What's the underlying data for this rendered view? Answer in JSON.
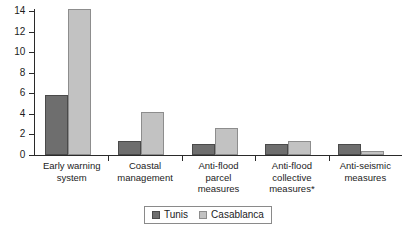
{
  "chart_data": {
    "type": "bar",
    "title": "",
    "subtitle": "",
    "xlabel": "",
    "ylabel": "",
    "ylim": [
      0,
      14
    ],
    "yticks": [
      0,
      2,
      4,
      6,
      8,
      10,
      12,
      14
    ],
    "grid": false,
    "legend_position": "bottom-center",
    "categories": [
      "Early warning system",
      "Coastal management",
      "Anti-flood parcel measures",
      "Anti-flood collective measures*",
      "Anti-seismic measures"
    ],
    "category_lines": [
      [
        "Early warning",
        "system"
      ],
      [
        "Coastal",
        "management"
      ],
      [
        "Anti-flood",
        "parcel",
        "measures"
      ],
      [
        "Anti-flood",
        "collective",
        "measures*"
      ],
      [
        "Anti-seismic",
        "measures"
      ]
    ],
    "series": [
      {
        "name": "Tunis",
        "color": "#6e6e6e",
        "values": [
          5.8,
          1.4,
          1.1,
          1.1,
          1.1
        ]
      },
      {
        "name": "Casablanca",
        "color": "#c2c2c2",
        "values": [
          14.2,
          4.2,
          2.6,
          1.35,
          0.35
        ]
      }
    ],
    "annotations": [
      "*"
    ]
  },
  "legend": {
    "items": [
      {
        "label": "Tunis",
        "swatch": "tunis-swatch"
      },
      {
        "label": "Casablanca",
        "swatch": "casablanca-swatch"
      }
    ]
  },
  "axis": {
    "y_tick_labels": [
      "0",
      "2",
      "4",
      "6",
      "8",
      "10",
      "12",
      "14"
    ]
  }
}
